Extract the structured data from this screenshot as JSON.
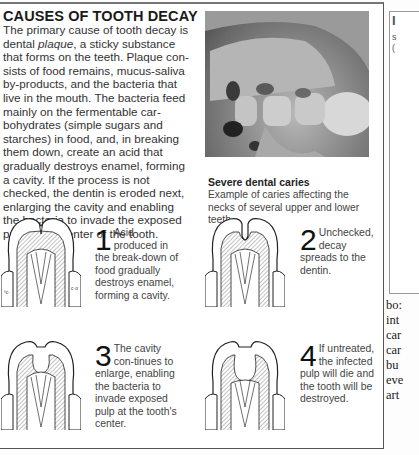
{
  "title": "CAUSES OF TOOTH DECAY",
  "intro_lines": [
    "The primary cause of tooth decay is",
    "dental plaque, a sticky substance",
    "that forms on the teeth. Plaque con-",
    "sists of food remains, mucus-saliva",
    "by-products, and the bacteria that",
    "live in the mouth. The bacteria feed",
    "mainly on the fermentable car-",
    "bohydrates (simple sugars and",
    "starches) in food, and, in breaking",
    "them down, create an acid that",
    "gradually destroys enamel, forming",
    "a cavity. If the process is not",
    "checked, the dentin is eroded next,",
    "enlarging the cavity and enabling",
    "the bacteria to invade the exposed",
    "pulp at the center of the tooth."
  ],
  "photo": {
    "alt": "Photograph of severe dental caries",
    "caption_title": "Severe dental caries",
    "caption_text": "Example of caries affecting the necks of several upper and lower teeth."
  },
  "steps": [
    {
      "number": "1",
      "text": "Acid produced in the break-down of food gradually destroys enamel, forming a cavity."
    },
    {
      "number": "2",
      "text": "Unchecked, decay spreads to the dentin."
    },
    {
      "number": "3",
      "text": "The cavity con-tinues to enlarge, enabling the bacteria to invade exposed pulp at the tooth's center."
    },
    {
      "number": "4",
      "text": "If untreated, the infected pulp will die and the tooth will be destroyed."
    }
  ],
  "right_column": {
    "fragment_lines": [
      "I",
      "s",
      "("
    ],
    "serif_lines": [
      "bo:",
      "int",
      "car",
      "car",
      "bu",
      "eve",
      "art"
    ]
  },
  "colors": {
    "border": "#555555",
    "text": "#333333",
    "title": "#1a1a1a"
  }
}
